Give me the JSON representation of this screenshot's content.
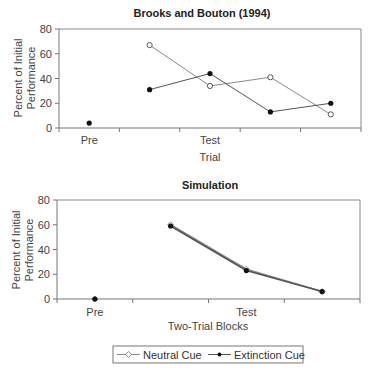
{
  "chart_data": [
    {
      "type": "line",
      "title": "Brooks and Bouton (1994)",
      "xlabel": "Trial",
      "ylabel": [
        "Percent of Initial",
        "Performance"
      ],
      "categories": [
        "Pre",
        "",
        "Test",
        "",
        ""
      ],
      "ylim": [
        0,
        80
      ],
      "yticks": [
        0,
        20,
        40,
        60,
        80
      ],
      "grid": false,
      "series": [
        {
          "name": "Neutral Cue",
          "marker": "open-circle",
          "values": [
            null,
            67,
            34,
            41,
            11
          ]
        },
        {
          "name": "Extinction Cue",
          "marker": "filled-circle",
          "values": [
            4,
            31,
            44,
            13,
            20
          ]
        }
      ]
    },
    {
      "type": "line",
      "title": "Simulation",
      "xlabel": "Two-Trial Blocks",
      "ylabel": [
        "Percent of Initial",
        "Performance"
      ],
      "categories": [
        "Pre",
        "",
        "Test",
        ""
      ],
      "ylim": [
        0,
        80
      ],
      "yticks": [
        0,
        20,
        40,
        60,
        80
      ],
      "grid": false,
      "series": [
        {
          "name": "Neutral Cue",
          "marker": "open-diamond",
          "values": [
            0,
            60,
            24,
            6
          ]
        },
        {
          "name": "Extinction Cue",
          "marker": "filled-circle",
          "values": [
            0,
            59,
            23,
            6
          ]
        }
      ]
    }
  ],
  "legend": {
    "placement": "bottom-center",
    "items": [
      {
        "label": "Neutral Cue",
        "marker": "open-diamond"
      },
      {
        "label": "Extinction Cue",
        "marker": "filled-circle"
      }
    ]
  },
  "colors": {
    "neutral_line": "#8a8a8a",
    "extinction_line": "#555555",
    "marker_fill": "#111111",
    "axis": "#777777"
  }
}
